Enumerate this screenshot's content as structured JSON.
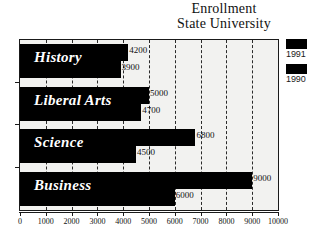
{
  "title": {
    "line1": "Enrollment",
    "line2": "State University"
  },
  "legend": {
    "position": "right",
    "entries": [
      {
        "label": "1991",
        "color": "#000000"
      },
      {
        "label": "1990",
        "color": "#000000"
      }
    ]
  },
  "axis": {
    "tick_labels": [
      "0",
      "1000",
      "2000",
      "3000",
      "4000",
      "5000",
      "6000",
      "7000",
      "8000",
      "9000",
      "10000"
    ]
  },
  "colors": {
    "bar": "#000000",
    "plot_background": "#f2f2f0",
    "frame": "#1a1a1a",
    "gridline": "#2a2a2a",
    "category_label": "#ffffff"
  },
  "chart_data": {
    "type": "bar",
    "orientation": "horizontal",
    "title": "Enrollment State University",
    "xlabel": "",
    "ylabel": "",
    "xlim": [
      0,
      10000
    ],
    "grid": true,
    "legend_position": "right",
    "categories": [
      "History",
      "Liberal Arts",
      "Science",
      "Business"
    ],
    "series": [
      {
        "name": "1991",
        "values": [
          4200,
          5000,
          6800,
          9000
        ]
      },
      {
        "name": "1990",
        "values": [
          3900,
          4700,
          4500,
          6000
        ]
      }
    ],
    "value_labels": [
      {
        "category": "History",
        "series": "1991",
        "text": "4200"
      },
      {
        "category": "History",
        "series": "1990",
        "text": "3900"
      },
      {
        "category": "Liberal Arts",
        "series": "1991",
        "text": "5000"
      },
      {
        "category": "Liberal Arts",
        "series": "1990",
        "text": "4700"
      },
      {
        "category": "Science",
        "series": "1991",
        "text": "6800"
      },
      {
        "category": "Science",
        "series": "1990",
        "text": "4500"
      },
      {
        "category": "Business",
        "series": "1991",
        "text": "9000"
      },
      {
        "category": "Business",
        "series": "1990",
        "text": "6000"
      }
    ]
  }
}
